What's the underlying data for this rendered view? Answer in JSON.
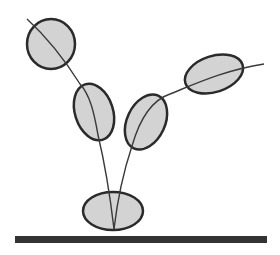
{
  "diagram": {
    "colors": {
      "background": "#ffffff",
      "fill": "#d3d3d3",
      "stroke": "#2a2a2a",
      "ground": "#333333"
    },
    "nodes": [
      {
        "id": "top-left-circle",
        "cx": 51,
        "cy": 44,
        "rx": 24,
        "ry": 25,
        "rotate": 0
      },
      {
        "id": "left-middle-ellipse",
        "cx": 94,
        "cy": 112,
        "rx": 19,
        "ry": 29,
        "rotate": -18
      },
      {
        "id": "right-middle-ellipse",
        "cx": 146,
        "cy": 122,
        "rx": 19,
        "ry": 29,
        "rotate": 25
      },
      {
        "id": "top-right-ellipse",
        "cx": 214,
        "cy": 74,
        "rx": 30,
        "ry": 18,
        "rotate": -18
      },
      {
        "id": "base-ellipse",
        "cx": 113,
        "cy": 211,
        "rx": 30,
        "ry": 19,
        "rotate": 0
      }
    ],
    "ground": {
      "x": 15,
      "y": 236,
      "width": 252,
      "height": 7
    }
  }
}
